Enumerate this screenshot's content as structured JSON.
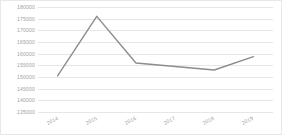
{
  "chart_data": {
    "type": "line",
    "title": "",
    "subtitle": "",
    "xlabel": "",
    "ylabel": "",
    "categories": [
      "2014",
      "2015",
      "2016",
      "2017",
      "2018",
      "2019"
    ],
    "series": [
      {
        "name": "",
        "values": [
          150500,
          176000,
          156000,
          154500,
          153000,
          158700
        ],
        "color": "#8c8c8c"
      }
    ],
    "ylim": [
      135000,
      180000
    ],
    "yticks": [
      135000,
      140000,
      145000,
      150000,
      155000,
      160000,
      165000,
      170000,
      175000,
      180000
    ],
    "ytick_labels": [
      "135000",
      "140000",
      "145000",
      "150000",
      "155000",
      "160000",
      "165000",
      "170000",
      "175000",
      "180000"
    ],
    "grid": true,
    "grid_color": "#e6e6e6",
    "legend": false,
    "legend_position": "none",
    "markers": false,
    "background_color": "#ffffff",
    "axis_label_color": "#a3a3a3",
    "border_color": "#e8e8e8"
  }
}
